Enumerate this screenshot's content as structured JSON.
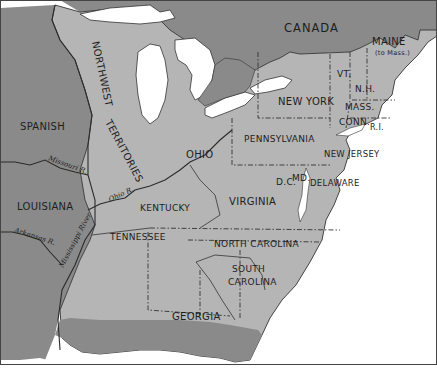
{
  "map": {
    "title": "",
    "colors": {
      "us_territory": "#b5b5b5",
      "foreign_territory": "#8a8a8a",
      "water": "#ffffff",
      "border": "#333333",
      "label": "#1e1e1e"
    },
    "foreign_regions": {
      "canada": "CANADA",
      "spanish": "SPANISH",
      "louisiana": "LOUISIANA"
    },
    "territories": {
      "northwest": "NORTHWEST TERRITORIES",
      "northwest_line1": "NORTHWEST",
      "northwest_line2": "TERRITORIES"
    },
    "states": {
      "maine": "MAINE",
      "maine_note": "(to Mass.)",
      "vermont": "VT.",
      "new_hampshire": "N.H.",
      "massachusetts": "MASS.",
      "connecticut": "CONN.",
      "rhode_island": "R.I.",
      "new_york": "NEW YORK",
      "pennsylvania": "PENNSYLVANIA",
      "new_jersey": "NEW JERSEY",
      "delaware": "DELAWARE",
      "maryland": "MD.",
      "dc": "D.C.",
      "ohio": "OHIO",
      "virginia": "VIRGINIA",
      "kentucky": "KENTUCKY",
      "tennessee": "TENNESSEE",
      "north_carolina": "NORTH CAROLINA",
      "south_carolina_line1": "SOUTH",
      "south_carolina_line2": "CAROLINA",
      "georgia": "GEORGIA"
    },
    "rivers": {
      "missouri": "Missouri R.",
      "ohio": "Ohio R.",
      "mississippi": "Mississippi River",
      "arkansas": "Arkansas R."
    }
  }
}
